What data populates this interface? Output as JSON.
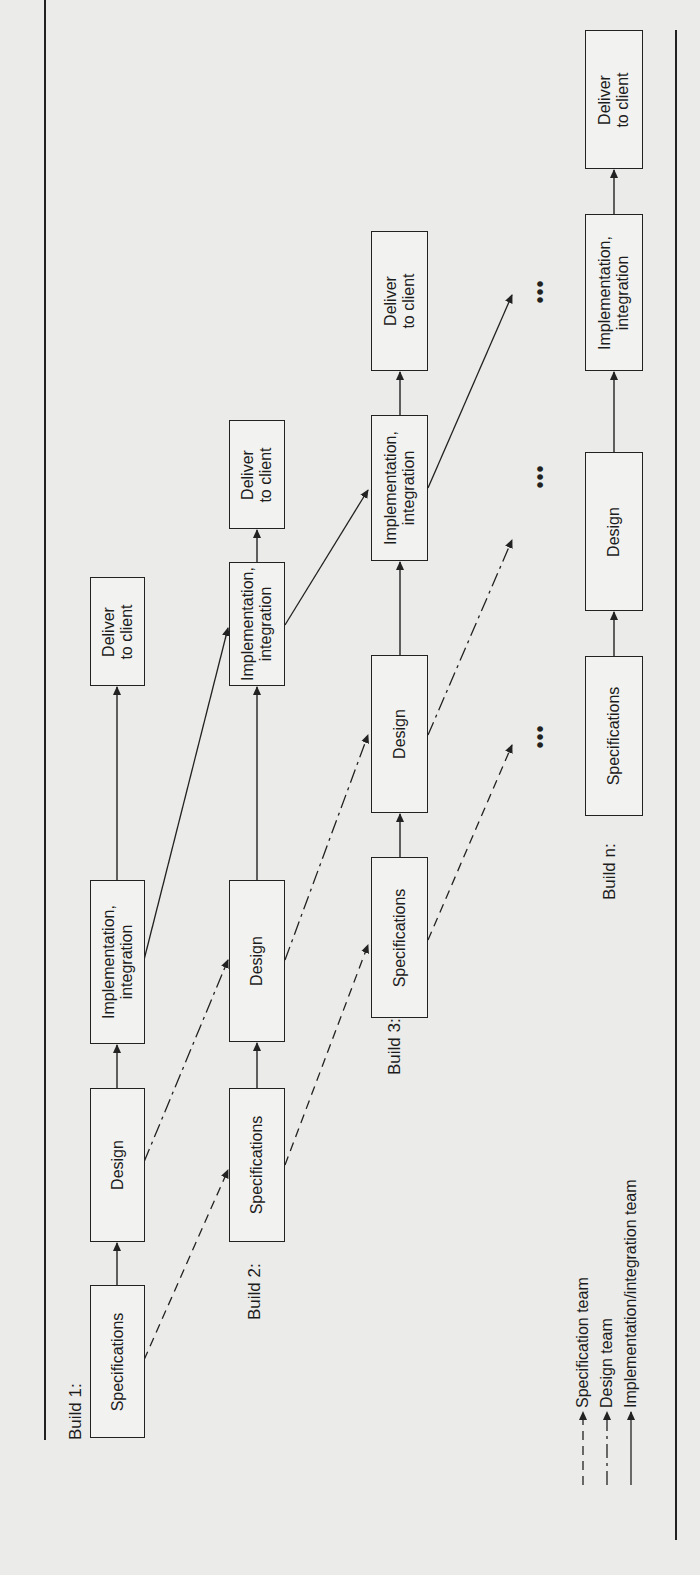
{
  "figure": {
    "orientation": "rotated-90-ccw",
    "builds": [
      {
        "label": "Build 1:",
        "phases": [
          "Specifications",
          "Design",
          "Implementation,\nintegration",
          "Deliver\nto client"
        ]
      },
      {
        "label": "Build 2:",
        "phases": [
          "Specifications",
          "Design",
          "Implementation,\nintegration",
          "Deliver\nto client"
        ]
      },
      {
        "label": "Build 3:",
        "phases": [
          "Specifications",
          "Design",
          "Implementation,\nintegration",
          "Deliver\nto client"
        ]
      },
      {
        "label": "Build n:",
        "phases": [
          "Specifications",
          "Design",
          "Implementation,\nintegration",
          "Deliver\nto client"
        ]
      }
    ],
    "ellipsis": "•••",
    "legend": [
      {
        "label": "Specification team",
        "line_style": "dashed"
      },
      {
        "label": "Design team",
        "line_style": "dash-dot"
      },
      {
        "label": "Implementation/integration team",
        "line_style": "solid"
      }
    ]
  }
}
